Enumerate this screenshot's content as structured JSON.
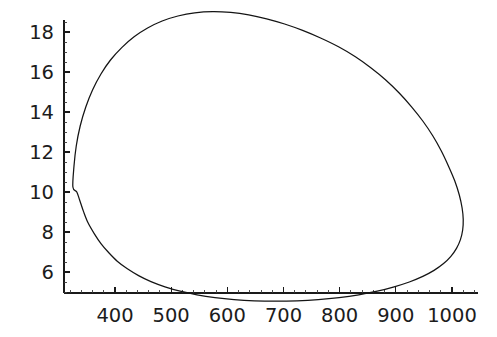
{
  "chart_data": {
    "type": "line",
    "title": "",
    "subtitle": "",
    "xlabel": "",
    "ylabel": "",
    "annotations": [],
    "legend": [],
    "legend_position": "none",
    "grid": false,
    "closed_curve": true,
    "xlim": [
      300,
      1060
    ],
    "ylim": [
      4.2,
      19.6
    ],
    "x_ticks_major": [
      400,
      500,
      600,
      700,
      800,
      900,
      1000
    ],
    "x_ticklabels": [
      "400",
      "500",
      "600",
      "700",
      "800",
      "900",
      "1000"
    ],
    "x_minor_per_interval": 5,
    "y_ticks_major": [
      6,
      8,
      10,
      12,
      14,
      16,
      18
    ],
    "y_ticklabels": [
      "6",
      "8",
      "10",
      "12",
      "14",
      "16",
      "18"
    ],
    "y_minor_per_interval": 4,
    "series": [
      {
        "name": "loop",
        "closed": true,
        "points": [
          [
            325,
            10.25
          ],
          [
            327,
            11.3
          ],
          [
            331,
            12.3
          ],
          [
            338,
            13.3
          ],
          [
            348,
            14.25
          ],
          [
            360,
            15.1
          ],
          [
            375,
            15.9
          ],
          [
            392,
            16.6
          ],
          [
            412,
            17.22
          ],
          [
            434,
            17.76
          ],
          [
            458,
            18.2
          ],
          [
            484,
            18.55
          ],
          [
            512,
            18.8
          ],
          [
            542,
            18.96
          ],
          [
            574,
            19.02
          ],
          [
            606,
            18.98
          ],
          [
            638,
            18.86
          ],
          [
            670,
            18.66
          ],
          [
            702,
            18.4
          ],
          [
            734,
            18.08
          ],
          [
            766,
            17.7
          ],
          [
            798,
            17.26
          ],
          [
            828,
            16.76
          ],
          [
            856,
            16.2
          ],
          [
            882,
            15.6
          ],
          [
            906,
            14.95
          ],
          [
            928,
            14.26
          ],
          [
            948,
            13.55
          ],
          [
            966,
            12.8
          ],
          [
            981,
            12.05
          ],
          [
            994,
            11.28
          ],
          [
            1005,
            10.55
          ],
          [
            1013,
            9.85
          ],
          [
            1018,
            9.2
          ],
          [
            1020,
            8.62
          ],
          [
            1019,
            8.1
          ],
          [
            1015,
            7.62
          ],
          [
            1008,
            7.18
          ],
          [
            998,
            6.78
          ],
          [
            985,
            6.42
          ],
          [
            968,
            6.08
          ],
          [
            948,
            5.78
          ],
          [
            924,
            5.5
          ],
          [
            897,
            5.26
          ],
          [
            867,
            5.04
          ],
          [
            834,
            4.86
          ],
          [
            799,
            4.72
          ],
          [
            762,
            4.62
          ],
          [
            724,
            4.56
          ],
          [
            686,
            4.54
          ],
          [
            648,
            4.56
          ],
          [
            612,
            4.62
          ],
          [
            578,
            4.72
          ],
          [
            546,
            4.86
          ],
          [
            516,
            5.04
          ],
          [
            489,
            5.26
          ],
          [
            464,
            5.52
          ],
          [
            442,
            5.82
          ],
          [
            422,
            6.16
          ],
          [
            404,
            6.54
          ],
          [
            389,
            6.96
          ],
          [
            375,
            7.42
          ],
          [
            363,
            7.92
          ],
          [
            352,
            8.46
          ],
          [
            344,
            9.02
          ],
          [
            337,
            9.6
          ],
          [
            332,
            10.0
          ]
        ]
      }
    ],
    "extrema": {
      "leftmost": [
        325,
        10.25
      ],
      "rightmost": [
        1020,
        8.62
      ],
      "topmost": [
        574,
        19.02
      ],
      "bottommost": [
        700,
        4.54
      ]
    }
  },
  "style": {
    "background_color": "#ffffff",
    "curve_color": "#141414",
    "axis_color": "#1a1a1a",
    "text_color": "#1c1c1c"
  }
}
